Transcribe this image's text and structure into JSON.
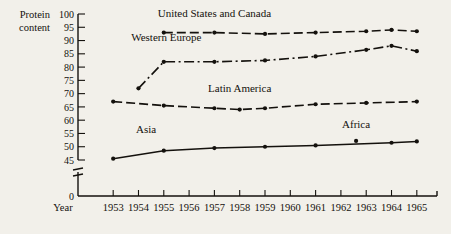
{
  "chart_data": {
    "type": "line",
    "title": "",
    "xlabel": "Year",
    "ylabel": "Protein content",
    "ylabel_line1": "Protein",
    "ylabel_line2": "content",
    "x": [
      1953,
      1954,
      1955,
      1956,
      1957,
      1958,
      1959,
      1960,
      1961,
      1962,
      1963,
      1964,
      1965
    ],
    "xlim": [
      1952.4,
      1965.6
    ],
    "ylim": [
      45,
      100
    ],
    "y_break": true,
    "y_break_labels": [
      "0"
    ],
    "yticks": [
      45,
      50,
      55,
      60,
      65,
      70,
      75,
      80,
      85,
      90,
      95,
      100
    ],
    "xticks": [
      "1953",
      "1954",
      "1955",
      "1956",
      "1957",
      "1958",
      "1959",
      "1960",
      "1961",
      "1962",
      "1963",
      "1964",
      "1965"
    ],
    "grid": false,
    "legend": "inline-labels",
    "series": [
      {
        "name": "United States and Canada",
        "style": "dashed",
        "label_x": 1957.0,
        "label_y": 99.0,
        "x": [
          1955,
          1957,
          1959,
          1961,
          1963,
          1964,
          1965
        ],
        "values": [
          93,
          93,
          92.5,
          93,
          93.5,
          94,
          93.5
        ]
      },
      {
        "name": "Western Europe",
        "style": "dash-dot",
        "label_x": 1955.1,
        "label_y": 90.0,
        "x": [
          1954,
          1955,
          1957,
          1959,
          1961,
          1963,
          1964,
          1965
        ],
        "values": [
          72,
          82,
          82,
          82.5,
          84,
          86.5,
          88,
          86
        ]
      },
      {
        "name": "Latin America",
        "style": "dashed",
        "label_x": 1958.0,
        "label_y": 70.5,
        "x": [
          1953,
          1955,
          1957,
          1958,
          1959,
          1961,
          1963,
          1965
        ],
        "values": [
          67,
          65.5,
          64.5,
          64,
          64.5,
          66,
          66.5,
          67
        ]
      },
      {
        "name": "Asia",
        "style": "solid",
        "label_x": 1954.3,
        "label_y": 55.0,
        "x": [
          1953,
          1955,
          1957,
          1959,
          1961,
          1964,
          1965
        ],
        "values": [
          45.5,
          48.5,
          49.5,
          50,
          50.5,
          51.5,
          52
        ]
      },
      {
        "name": "Africa",
        "style": "point",
        "label_x": 1962.6,
        "label_y": 57.0,
        "x": [
          1962.6
        ],
        "values": [
          52.2
        ]
      }
    ]
  }
}
